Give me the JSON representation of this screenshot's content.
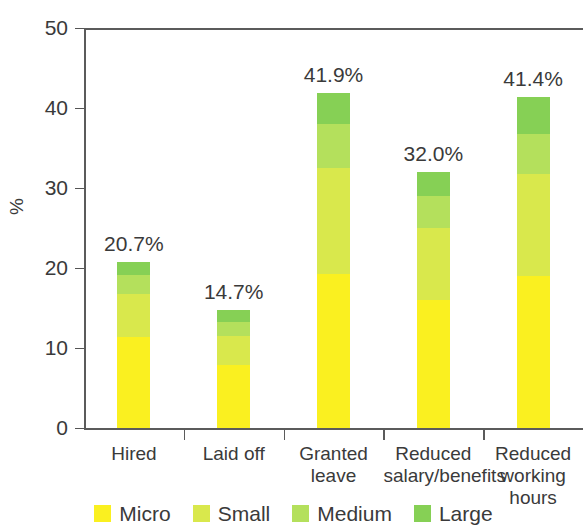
{
  "chart_data": {
    "type": "bar",
    "subtype": "stacked-bar",
    "title": "",
    "xlabel": "",
    "ylabel": "%",
    "ylim": [
      0,
      50
    ],
    "ytick_labels": [
      "50",
      "40",
      "30",
      "20",
      "10",
      "0"
    ],
    "ytick_values": [
      50,
      40,
      30,
      20,
      10,
      0
    ],
    "grid": false,
    "legend_position": "bottom",
    "categories": [
      "Hired",
      "Laid off",
      "Granted leave",
      "Reduced salary/benefits",
      "Reduced working hours"
    ],
    "category_label_lines": [
      [
        "Hired"
      ],
      [
        "Laid off"
      ],
      [
        "Granted",
        "leave"
      ],
      [
        "Reduced",
        "salary/benefits"
      ],
      [
        "Reduced",
        "working",
        "hours"
      ]
    ],
    "series": [
      {
        "name": "Micro",
        "color": "#faf020",
        "values": [
          11.4,
          7.9,
          19.2,
          16.0,
          19.0
        ]
      },
      {
        "name": "Small",
        "color": "#d9e84c",
        "values": [
          5.3,
          3.6,
          13.3,
          9.0,
          12.7
        ]
      },
      {
        "name": "Medium",
        "color": "#b4e05c",
        "values": [
          2.4,
          1.8,
          5.5,
          4.0,
          5.0
        ]
      },
      {
        "name": "Large",
        "color": "#86d055",
        "values": [
          1.6,
          1.4,
          3.9,
          3.0,
          4.7
        ]
      }
    ],
    "totals": [
      20.7,
      14.7,
      41.9,
      32.0,
      41.4
    ],
    "total_labels": [
      "20.7%",
      "14.7%",
      "41.9%",
      "32.0%",
      "41.4%"
    ],
    "legend_entries": [
      {
        "label": "Micro",
        "color": "#faf020"
      },
      {
        "label": "Small",
        "color": "#d9e84c"
      },
      {
        "label": "Medium",
        "color": "#b4e05c"
      },
      {
        "label": "Large",
        "color": "#86d055"
      }
    ]
  }
}
